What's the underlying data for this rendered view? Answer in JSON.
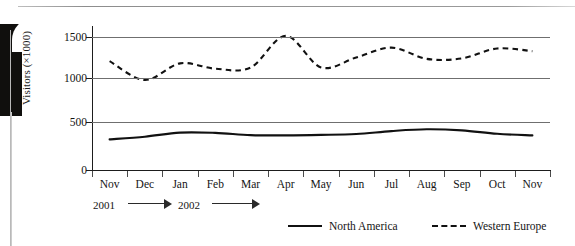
{
  "chart_data": {
    "type": "line",
    "title": "",
    "xlabel": "",
    "ylabel": "Visitors (×1000)",
    "categories": [
      "Nov",
      "Dec",
      "Jan",
      "Feb",
      "Mar",
      "Apr",
      "May",
      "Jun",
      "Jul",
      "Aug",
      "Sep",
      "Oct",
      "Nov"
    ],
    "ylim": [
      0,
      1600
    ],
    "yticks": [
      0,
      500,
      1000,
      1500
    ],
    "ytick_labels": [
      "0",
      "500",
      "1000",
      "1500"
    ],
    "grid": true,
    "legend_position": "bottom-right",
    "period_labels": [
      {
        "year": "2001",
        "arrow": "→"
      },
      {
        "year": "2002",
        "arrow": "→"
      }
    ],
    "series": [
      {
        "name": "North America",
        "style": "solid",
        "color": "#111111",
        "values": [
          340,
          370,
          415,
          412,
          388,
          385,
          390,
          400,
          432,
          452,
          440,
          402,
          385
        ]
      },
      {
        "name": "Western Europe",
        "style": "dashed",
        "color": "#111111",
        "values": [
          1210,
          1000,
          1185,
          1125,
          1138,
          1490,
          1140,
          1250,
          1360,
          1235,
          1240,
          1350,
          1320
        ]
      }
    ]
  },
  "axis": {
    "y_title": "Visitors (×1000)",
    "y_ticks": [
      "1500",
      "1000",
      "500",
      "0"
    ],
    "x_ticks": [
      "Nov",
      "Dec",
      "Jan",
      "Feb",
      "Mar",
      "Apr",
      "May",
      "Jun",
      "Jul",
      "Aug",
      "Sep",
      "Oct",
      "Nov"
    ]
  },
  "years": {
    "first": "2001",
    "second": "2002"
  },
  "legend": {
    "north_america": "North America",
    "western_europe": "Western Europe"
  }
}
